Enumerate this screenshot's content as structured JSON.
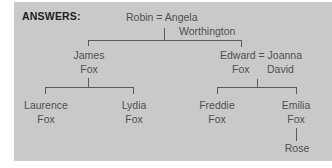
{
  "diagram": {
    "type": "family-tree",
    "title": "ANSWERS:",
    "colors": {
      "panel": "#c9c9c9",
      "text": "#505050",
      "title": "#1e1e1e",
      "lines": "#5a5a5a"
    },
    "nodes": {
      "robin_angela": {
        "line1": "Robin = Angela",
        "line2": "Worthington"
      },
      "james": {
        "line1": "James",
        "line2": "Fox"
      },
      "edward_joanna": {
        "line1": "Edward = Joanna",
        "line2": "Fox      David"
      },
      "laurence": {
        "line1": "Laurence",
        "line2": "Fox"
      },
      "lydia": {
        "line1": "Lydia",
        "line2": "Fox"
      },
      "freddie": {
        "line1": "Freddie",
        "line2": "Fox"
      },
      "emilia": {
        "line1": "Emilia",
        "line2": "Fox"
      },
      "rose": {
        "line1": "Rose"
      }
    },
    "relationships": [
      {
        "parents": "Robin = Angela Worthington",
        "children": [
          "James Fox",
          "Edward Fox"
        ]
      },
      {
        "parents": "James Fox",
        "children": [
          "Laurence Fox",
          "Lydia Fox"
        ]
      },
      {
        "parents": "Edward Fox = Joanna David",
        "children": [
          "Freddie Fox",
          "Emilia Fox"
        ]
      },
      {
        "parents": "Emilia Fox",
        "children": [
          "Rose"
        ]
      }
    ]
  }
}
